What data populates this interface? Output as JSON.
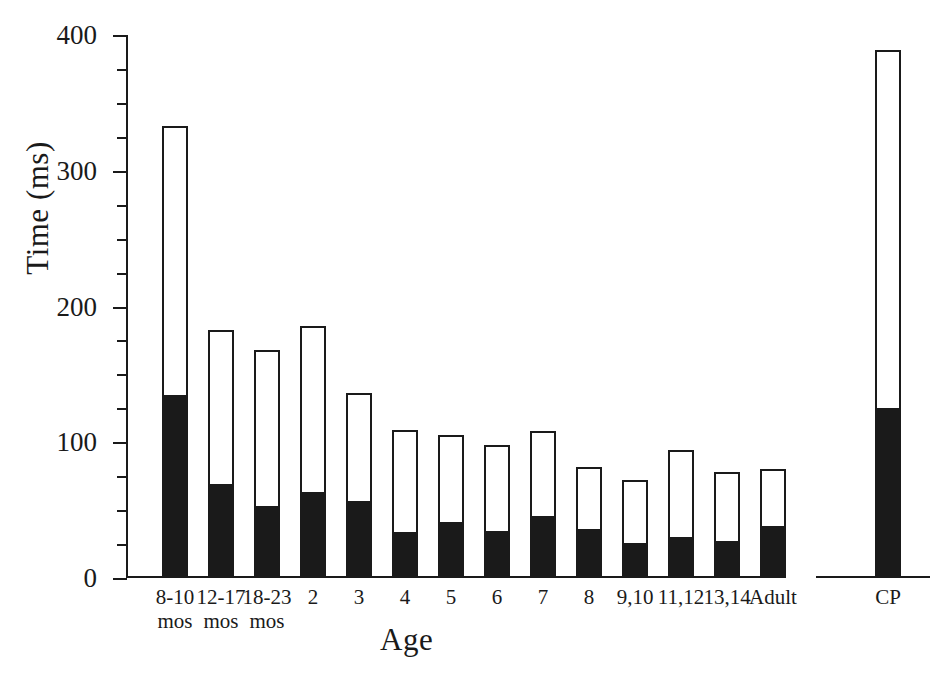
{
  "chart_data": {
    "type": "bar",
    "title": "",
    "xlabel": "Age",
    "ylabel": "Time (ms)",
    "ylim": [
      0,
      400
    ],
    "yticks": [
      0,
      100,
      200,
      300,
      400
    ],
    "ytick_labels": [
      "0",
      "100",
      "200",
      "300",
      "400"
    ],
    "minor_tick_step": 25,
    "grid": false,
    "legend": "none",
    "stacked": true,
    "categories": [
      "8-10 mos",
      "12-17 mos",
      "18-23 mos",
      "2",
      "3",
      "4",
      "5",
      "6",
      "7",
      "8",
      "9,10",
      "11,12",
      "13,14",
      "Adult",
      "CP"
    ],
    "category_lines": [
      [
        "8-10",
        "mos"
      ],
      [
        "12-17",
        "mos"
      ],
      [
        "18-23",
        "mos"
      ],
      [
        "2",
        ""
      ],
      [
        "3",
        ""
      ],
      [
        "4",
        ""
      ],
      [
        "5",
        ""
      ],
      [
        "6",
        ""
      ],
      [
        "7",
        ""
      ],
      [
        "8",
        ""
      ],
      [
        "9,10",
        ""
      ],
      [
        "11,12",
        ""
      ],
      [
        "13,14",
        ""
      ],
      [
        "Adult",
        ""
      ],
      [
        "CP",
        ""
      ]
    ],
    "series": [
      {
        "name": "lower (filled black)",
        "color": "#1a1a1a",
        "values": [
          135,
          69,
          53,
          63,
          57,
          34,
          41,
          35,
          46,
          36,
          26,
          30,
          27,
          38,
          125
        ]
      },
      {
        "name": "total (open bar)",
        "color": "#ffffff",
        "values": [
          333,
          183,
          168,
          186,
          136,
          109,
          105,
          98,
          108,
          82,
          72,
          94,
          78,
          80,
          389
        ]
      }
    ],
    "axis_break_before": "CP"
  },
  "figure": {
    "background": "#ffffff",
    "ink": "#1a1a1a"
  }
}
